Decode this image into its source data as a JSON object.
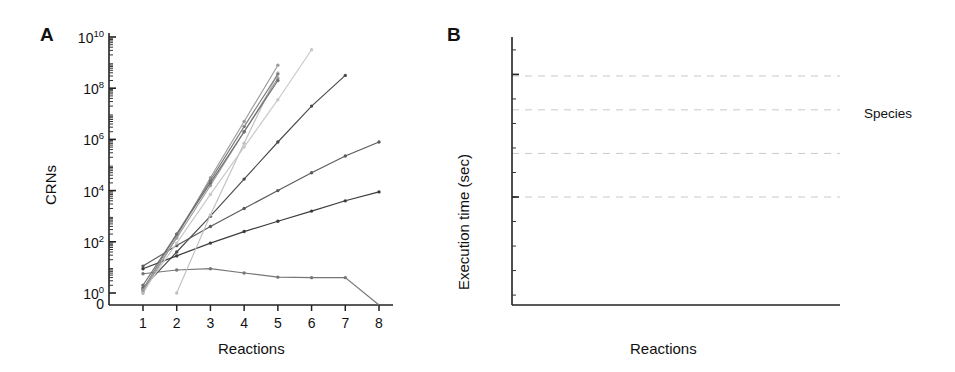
{
  "figure": {
    "panels": [
      {
        "letter": "A",
        "xlabel": "Reactions",
        "ylabel": "CRNs",
        "xticks": [
          "1",
          "2",
          "3",
          "4",
          "5",
          "6",
          "7",
          "8"
        ],
        "yticks": [
          "0",
          "10^0",
          "10^2",
          "10^4",
          "10^6",
          "10^8",
          "10^10"
        ],
        "ytick_html": [
          "0",
          "10<sup>0</sup>",
          "10<sup>2</sup>",
          "10<sup>4</sup>",
          "10<sup>6</sup>",
          "10<sup>8</sup>",
          "10<sup>10</sup>"
        ]
      },
      {
        "letter": "B",
        "xlabel": "Reactions",
        "ylabel": "Execution time (sec)",
        "xticks": [
          "1",
          "2",
          "3",
          "4",
          "5",
          "6",
          "7",
          "8"
        ],
        "yticks": [
          "10^0",
          "10^5"
        ],
        "ytick_html": [
          "10<sup>0</sup>",
          "10<sup>5</sup>"
        ],
        "annotations": [
          "day",
          "hour",
          "minute",
          "second"
        ]
      }
    ]
  },
  "legend": {
    "title": "Species",
    "items": [
      {
        "label": "10",
        "color": "#6e6e6e"
      },
      {
        "label": "9",
        "color": "#9a9a9a"
      },
      {
        "label": "8",
        "color": "#c8c8c8"
      },
      {
        "label": "7",
        "color": "#7e7e7e"
      },
      {
        "label": "6",
        "color": "#9c9c9c"
      },
      {
        "label": "5",
        "color": "#c0c0c0"
      },
      {
        "label": "4",
        "color": "#3c3c3c"
      },
      {
        "label": "3",
        "color": "#5a5a5a"
      },
      {
        "label": "2",
        "color": "#4a4a4a"
      },
      {
        "label": "1",
        "color": "#767676"
      }
    ]
  },
  "chart_data": {
    "type": "line",
    "title": "",
    "panels": [
      {
        "id": "A",
        "title": "",
        "xlabel": "Reactions",
        "ylabel": "CRNs",
        "yscale": "log",
        "xlim": [
          1,
          8
        ],
        "ylim_exponent": [
          0,
          10
        ],
        "xticks": [
          1,
          2,
          3,
          4,
          5,
          6,
          7,
          8
        ],
        "ytick_exponents": [
          0,
          2,
          4,
          6,
          8,
          10
        ],
        "zero_tick": true,
        "grid": false,
        "series": [
          {
            "name": "1",
            "color": "#767676",
            "x": [
              1,
              2,
              3,
              4,
              5,
              6,
              7,
              8
            ],
            "y_exponent": [
              0.75,
              0.9,
              0.95,
              0.78,
              0.62,
              0.6,
              0.6,
              null
            ],
            "drops_to_zero_at": 8
          },
          {
            "name": "2",
            "color": "#4a4a4a",
            "x": [
              1,
              2,
              3,
              4,
              5,
              6,
              7
            ],
            "y_exponent": [
              0.2,
              1.6,
              3.0,
              4.45,
              5.9,
              7.3,
              8.5
            ],
            "drops_to_zero_at": null
          },
          {
            "name": "3",
            "color": "#5a5a5a",
            "x": [
              1,
              2,
              3,
              4,
              5,
              6,
              7,
              8
            ],
            "y_exponent": [
              1.05,
              1.85,
              2.6,
              3.3,
              4.0,
              4.7,
              5.35,
              5.9
            ],
            "drops_to_zero_at": null
          },
          {
            "name": "4",
            "color": "#3c3c3c",
            "x": [
              1,
              2,
              3,
              4,
              5,
              6,
              7,
              8
            ],
            "y_exponent": [
              0.95,
              1.45,
              1.95,
              2.4,
              2.8,
              3.2,
              3.6,
              3.95
            ],
            "drops_to_zero_at": null
          },
          {
            "name": "5",
            "color": "#c0c0c0",
            "x": [
              2,
              3,
              4,
              5
            ],
            "y_exponent": [
              0.0,
              3.05,
              5.85,
              8.6
            ],
            "drops_to_zero_at": null
          },
          {
            "name": "6",
            "color": "#9c9c9c",
            "x": [
              1,
              2,
              3,
              4,
              5
            ],
            "y_exponent": [
              0.0,
              2.2,
              4.5,
              6.7,
              8.9
            ],
            "drops_to_zero_at": null
          },
          {
            "name": "7",
            "color": "#7e7e7e",
            "x": [
              1,
              2,
              3,
              4,
              5
            ],
            "y_exponent": [
              0.15,
              2.3,
              4.4,
              6.5,
              8.55
            ],
            "drops_to_zero_at": null
          },
          {
            "name": "8",
            "color": "#c8c8c8",
            "x": [
              1,
              2,
              3,
              4,
              5,
              6
            ],
            "y_exponent": [
              0.05,
              1.95,
              3.85,
              5.7,
              7.55,
              9.5
            ],
            "drops_to_zero_at": null
          },
          {
            "name": "9",
            "color": "#9a9a9a",
            "x": [
              1,
              2,
              3,
              4,
              5
            ],
            "y_exponent": [
              0.1,
              2.15,
              4.2,
              6.3,
              8.4
            ],
            "drops_to_zero_at": null
          },
          {
            "name": "10",
            "color": "#6e6e6e",
            "x": [
              1,
              2,
              3,
              4,
              5
            ],
            "y_exponent": [
              0.3,
              2.3,
              4.3,
              6.3,
              8.3
            ],
            "drops_to_zero_at": null
          }
        ]
      },
      {
        "id": "B",
        "title": "",
        "xlabel": "Reactions",
        "ylabel": "Execution time (sec)",
        "yscale": "log",
        "xlim": [
          1,
          8
        ],
        "ytick_exponents": [
          0,
          5
        ],
        "reference_lines": [
          {
            "label": "second",
            "y_exponent": 0
          },
          {
            "label": "minute",
            "y_exponent": 1.778
          },
          {
            "label": "hour",
            "y_exponent": 3.556
          },
          {
            "label": "day",
            "y_exponent": 4.937
          }
        ],
        "grid": true,
        "series": [
          {
            "name": "1",
            "color": "#767676",
            "x": [
              1,
              2,
              3,
              4,
              5,
              6,
              7,
              8
            ],
            "y_exponent": [
              -3.3,
              -3.2,
              -3.2,
              -3.2,
              -3.2,
              -3.2,
              -3.25,
              null
            ],
            "drops_to_zero_at": 8
          },
          {
            "name": "2",
            "color": "#4a4a4a",
            "x": [
              1,
              2,
              3,
              4,
              5,
              6,
              7,
              8
            ],
            "y_exponent": [
              -3.3,
              -2.25,
              -1.2,
              -0.2,
              0.85,
              1.85,
              2.85,
              3.8
            ],
            "drops_to_zero_at": null
          },
          {
            "name": "3",
            "color": "#5a5a5a",
            "x": [
              1,
              2,
              3,
              4,
              5,
              6,
              7
            ],
            "y_exponent": [
              -3.3,
              -1.95,
              -0.6,
              0.75,
              2.1,
              3.4,
              4.85
            ],
            "drops_to_zero_at": null
          },
          {
            "name": "4",
            "color": "#3c3c3c",
            "x": [
              1,
              2,
              3,
              4,
              5,
              6,
              7,
              8
            ],
            "y_exponent": [
              -3.3,
              -2.75,
              -2.3,
              -1.95,
              -1.65,
              -1.45,
              -1.35,
              -1.3
            ],
            "drops_to_zero_at": null
          },
          {
            "name": "5",
            "color": "#c0c0c0",
            "x": [
              1,
              2,
              3,
              4,
              5
            ],
            "y_exponent": [
              -3.3,
              -1.4,
              0.5,
              2.4,
              4.35
            ],
            "drops_to_zero_at": null
          },
          {
            "name": "6",
            "color": "#9c9c9c",
            "x": [
              1,
              2,
              3,
              4,
              5
            ],
            "y_exponent": [
              -3.3,
              -1.45,
              0.45,
              2.3,
              4.2
            ],
            "drops_to_zero_at": null
          },
          {
            "name": "7",
            "color": "#7e7e7e",
            "x": [
              1,
              2,
              3,
              4,
              5
            ],
            "y_exponent": [
              -3.3,
              -1.55,
              0.2,
              1.95,
              3.7
            ],
            "drops_to_zero_at": null
          },
          {
            "name": "8",
            "color": "#c8c8c8",
            "x": [
              1,
              2,
              3,
              4,
              5
            ],
            "y_exponent": [
              -3.3,
              -1.35,
              0.6,
              2.55,
              4.5
            ],
            "drops_to_zero_at": null
          },
          {
            "name": "9",
            "color": "#9a9a9a",
            "x": [
              1,
              2,
              3,
              4,
              5
            ],
            "y_exponent": [
              -3.3,
              -1.5,
              0.3,
              2.1,
              3.9
            ],
            "drops_to_zero_at": null
          },
          {
            "name": "10",
            "color": "#6e6e6e",
            "x": [
              1,
              2,
              3,
              4,
              5
            ],
            "y_exponent": [
              -3.3,
              -1.6,
              0.1,
              1.8,
              3.55
            ],
            "drops_to_zero_at": null
          }
        ]
      }
    ]
  }
}
